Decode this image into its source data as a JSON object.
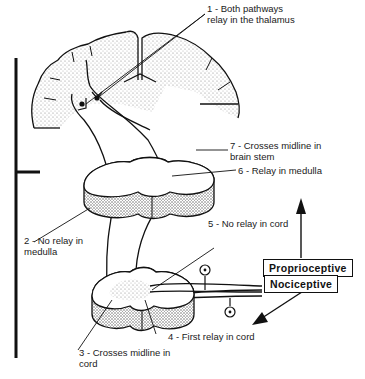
{
  "diagram": {
    "type": "neural pathway diagram",
    "structures": [
      "cerebral cortex (brain section)",
      "medulla section",
      "spinal cord section"
    ],
    "labels": [
      {
        "id": "1",
        "text_line1": "1 - Both pathways",
        "text_line2": "relay in the thalamus"
      },
      {
        "id": "7",
        "text_line1": "7 - Crosses midline in",
        "text_line2": "brain stem"
      },
      {
        "id": "6",
        "text_line1": "6 - Relay in medulla"
      },
      {
        "id": "2",
        "text_line1": "2 - No relay in",
        "text_line2": "medulla"
      },
      {
        "id": "5",
        "text_line1": "5 - No relay in cord"
      },
      {
        "id": "4",
        "text_line1": "4 - First relay in cord"
      },
      {
        "id": "3",
        "text_line1": "3 - Crosses midline in",
        "text_line2": "cord"
      }
    ],
    "boxes": {
      "proprioceptive": "Proprioceptive",
      "nociceptive": "Nociceptive"
    },
    "colors": {
      "ink": "#111111",
      "stipple": "#9a9a9a",
      "background": "#ffffff"
    }
  }
}
